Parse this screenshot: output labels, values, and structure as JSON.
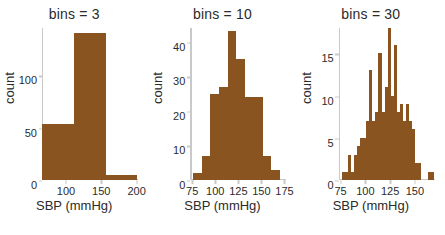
{
  "figure": {
    "background": "#ffffff",
    "bar_color": "#8a5420",
    "axis_color": "#c9c9c9",
    "text_color": "#2b2b2b"
  },
  "chart_data": [
    {
      "type": "bar",
      "title": "bins = 3",
      "xlabel": "SBP (mmHg)",
      "ylabel": "count",
      "xlim": [
        66,
        202
      ],
      "ylim": [
        0,
        145
      ],
      "xticks": [
        100,
        150,
        200
      ],
      "yticks": [
        0,
        50,
        100
      ],
      "xtick_labels": [
        "100",
        "150",
        "200"
      ],
      "ytick_labels": [
        "0",
        "50",
        "100"
      ],
      "grid": false,
      "bin_edges": [
        66,
        111,
        156,
        201
      ],
      "values": [
        53,
        140,
        5
      ]
    },
    {
      "type": "bar",
      "title": "bins = 10",
      "xlabel": "SBP (mmHg)",
      "ylabel": "count",
      "xlim": [
        73,
        177
      ],
      "ylim": [
        0,
        44
      ],
      "xticks": [
        75,
        100,
        125,
        150,
        175
      ],
      "yticks": [
        0,
        10,
        20,
        30,
        40
      ],
      "xtick_labels": [
        "75",
        "100",
        "125",
        "150",
        "175"
      ],
      "ytick_labels": [
        "0",
        "10",
        "20",
        "30",
        "40"
      ],
      "grid": false,
      "bin_edges": [
        76,
        85.4,
        94.8,
        104.2,
        113.6,
        123,
        132.4,
        141.8,
        151.2,
        160.6,
        170
      ],
      "values": [
        2,
        7,
        25,
        27,
        43,
        35,
        24,
        24,
        7,
        3
      ]
    },
    {
      "type": "bar",
      "title": "bins = 30",
      "xlabel": "SBP (mmHg)",
      "ylabel": "count",
      "xlim": [
        73,
        170
      ],
      "ylim": [
        0,
        18
      ],
      "xticks": [
        75,
        100,
        125,
        150
      ],
      "yticks": [
        0,
        5,
        10,
        15
      ],
      "xtick_labels": [
        "75",
        "100",
        "125",
        "150"
      ],
      "ytick_labels": [
        "0",
        "5",
        "10",
        "15"
      ],
      "grid": false,
      "bin_edges": [
        76,
        79.1,
        82.2,
        85.3,
        88.4,
        91.5,
        94.6,
        97.7,
        100.8,
        103.9,
        107,
        110.1,
        113.2,
        116.3,
        119.4,
        122.5,
        125.6,
        128.7,
        131.8,
        134.9,
        138,
        141.1,
        144.2,
        147.3,
        150.4,
        153.5,
        156.6,
        159.7,
        162.8,
        165.9,
        169
      ],
      "values": [
        1,
        1,
        3,
        1,
        3,
        4,
        5,
        5,
        7,
        13,
        7,
        8,
        15,
        8,
        11,
        18,
        10,
        16,
        8,
        9,
        7,
        9,
        7,
        6,
        2,
        2,
        0,
        0,
        1,
        1
      ]
    }
  ]
}
